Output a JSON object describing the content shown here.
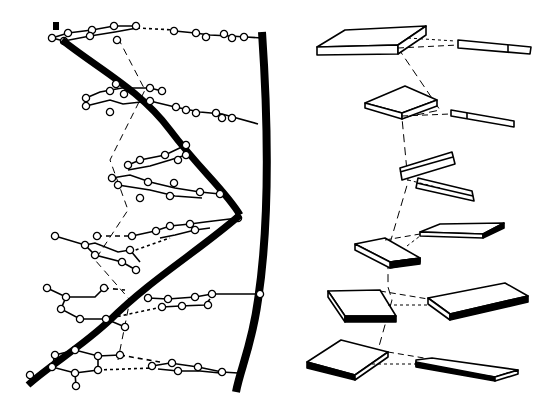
{
  "figure": {
    "description": "Side-by-side illustration of a DNA double helix: left panel shows ball-and-stick base pairs stacked between two sugar-phosphate backbone strands; right panel shows the same stack schematically as paired flat slabs.",
    "colors": {
      "ink": "#000000",
      "background": "#ffffff"
    }
  },
  "left_panel": {
    "name": "ball-and-stick helix",
    "backbone_strands": 2,
    "base_pairs": 6
  },
  "right_panel": {
    "name": "slab model",
    "slab_pairs": 6
  }
}
